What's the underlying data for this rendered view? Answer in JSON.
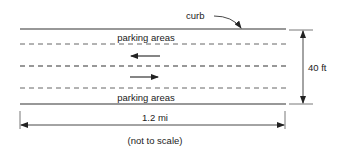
{
  "diagram": {
    "curb_label": "curb",
    "top_parking_label": "parking areas",
    "bottom_parking_label": "parking areas",
    "width_dimension": "40 ft",
    "length_dimension": "1.2 mi",
    "scale_note": "(not to scale)",
    "traffic_directions": [
      "left",
      "right"
    ],
    "colors": {
      "line": "#333333",
      "text": "#222222",
      "background": "#ffffff"
    }
  }
}
